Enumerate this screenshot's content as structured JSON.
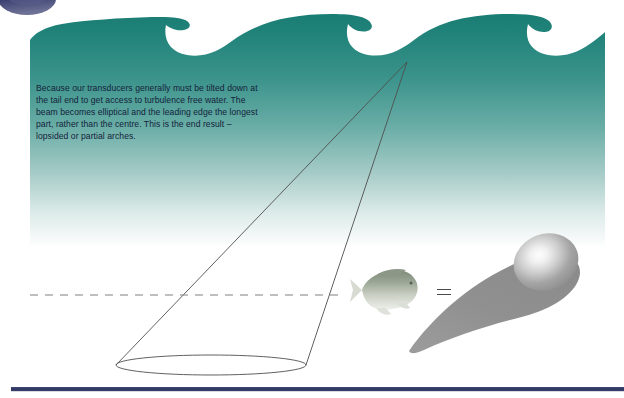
{
  "page": {
    "width": 624,
    "height": 398,
    "background": "#ffffff"
  },
  "caption": {
    "text": "Because our transducers generally must be tilted down at the tail end to get access to turbulence free water. The beam becomes elliptical and the leading edge the longest part, rather than the centre. This is the end result – lopsided or partial arches."
  },
  "colors": {
    "water_top": "#1d8178",
    "water_mid": "#57a59c",
    "water_bottom": "#ffffff",
    "navy": "#383d6c",
    "navy_bar": "#2f3760",
    "cone_line": "#4b4b4b",
    "dashed_line": "#7a7a7a",
    "arch_gray": "#8d8d8d",
    "arch_highlight": "#f2f2f2",
    "fish_body": "#a8b0a2",
    "fish_belly": "#e8eae4",
    "caption_text": "#13223a"
  },
  "graphics": {
    "logo_ellipse": {
      "name": "navy-logo-ellipse",
      "cx": 27,
      "cy": 0,
      "rx": 28,
      "ry": 15
    },
    "wave": {
      "name": "teal-wave-band",
      "crest_count": 4,
      "right_edge": 605,
      "top": 14,
      "fade_bottom": 240
    },
    "cone": {
      "name": "sonar-beam-cone",
      "apex_x": 407,
      "apex_y": 62,
      "base_cx": 211,
      "base_cy": 365,
      "base_rx": 95,
      "base_ry": 10
    },
    "dashed_line": {
      "name": "horizontal-reference-line",
      "x1": 30,
      "x2": 342,
      "y": 295,
      "dash": "8 7"
    },
    "fish": {
      "name": "fish-target",
      "cx": 381,
      "cy": 289,
      "length": 62,
      "facing": "right"
    },
    "arch": {
      "name": "partial-arch-echo",
      "bulb_cx": 545,
      "bulb_cy": 262,
      "tail_x": 409,
      "tail_y": 350
    },
    "bottom_bar": {
      "name": "navy-footer-bar",
      "x": 11,
      "y": 387,
      "width": 613,
      "height": 4
    }
  },
  "equals": {
    "symbol": "=",
    "label": "equals-sign"
  }
}
